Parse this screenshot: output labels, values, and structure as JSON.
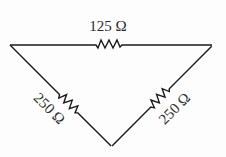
{
  "diagram": {
    "type": "resistor-triangle-circuit",
    "resistors": [
      {
        "position": "top",
        "label": "125 Ω",
        "value_ohms": 125
      },
      {
        "position": "left",
        "label": "250 Ω",
        "value_ohms": 250
      },
      {
        "position": "right",
        "label": "250 Ω",
        "value_ohms": 250
      }
    ],
    "colors": {
      "line": "#1a1a1a",
      "text": "#2a2a2a",
      "background": "#fdfdfd"
    }
  }
}
